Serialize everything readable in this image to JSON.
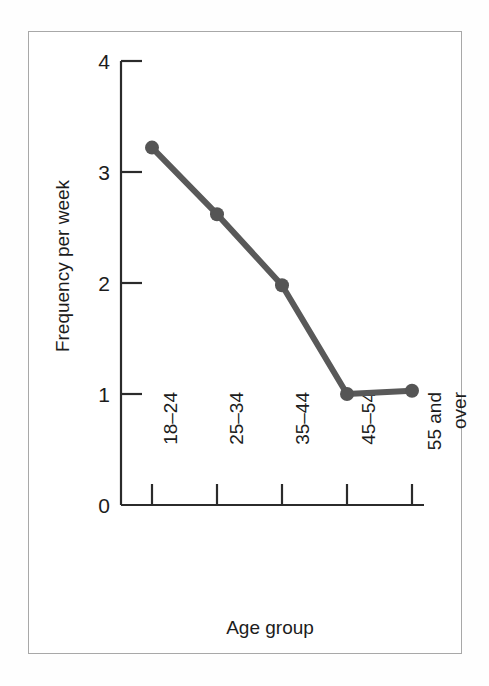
{
  "chart_data": {
    "type": "line",
    "title": "",
    "xlabel": "Age group",
    "ylabel": "Frequency per week",
    "categories": [
      "18–24",
      "25–34",
      "35–44",
      "45–54",
      "55 and over"
    ],
    "category_lines": [
      [
        "18–24"
      ],
      [
        "25–34"
      ],
      [
        "35–44"
      ],
      [
        "45–54"
      ],
      [
        "55 and",
        "over"
      ]
    ],
    "values": [
      3.22,
      2.62,
      1.98,
      1.0,
      1.03
    ],
    "ylim": [
      0,
      4
    ],
    "yticks": [
      0,
      1,
      2,
      3,
      4
    ],
    "ytick_labels": [
      "0",
      "1",
      "2",
      "3",
      "4"
    ],
    "grid": false,
    "legend": "none",
    "series": [
      {
        "name": "Frequency per week",
        "values": [
          3.22,
          2.62,
          1.98,
          1.0,
          1.03
        ]
      }
    ],
    "colors": {
      "line": "#595959",
      "marker": "#555555",
      "axis": "#2b2b2b",
      "frame": "#a8a8a8",
      "text": "#1c1c1c",
      "background": "#ffffff"
    }
  }
}
